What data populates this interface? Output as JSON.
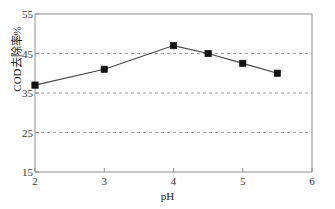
{
  "chart_data": {
    "type": "line",
    "title": "",
    "subtitle": "",
    "xlabel": "pH",
    "ylabel": "COD去除率%",
    "x": [
      2,
      3,
      4,
      4.5,
      5,
      5.5
    ],
    "values": [
      37,
      41,
      47,
      45,
      42.5,
      40
    ],
    "series": [
      {
        "name": "COD removal rate",
        "x": [
          2,
          3,
          4,
          4.5,
          5,
          5.5
        ],
        "values": [
          37,
          41,
          47,
          45,
          42.5,
          40
        ],
        "marker": "square",
        "marker_color": "#111111",
        "line_color": "#444444"
      }
    ],
    "xlim": [
      2,
      6
    ],
    "ylim": [
      15,
      55
    ],
    "xticks": [
      "2",
      "3",
      "4",
      "5",
      "6"
    ],
    "xtick_values": [
      2,
      3,
      4,
      5,
      6
    ],
    "yticks": [
      "15",
      "25",
      "35",
      "45",
      "55"
    ],
    "ytick_values": [
      15,
      25,
      35,
      45,
      55
    ],
    "grid": "horizontal-dashed",
    "gridlines_y": [
      25,
      35,
      45
    ],
    "grid_color": "#9a9a9a",
    "legend": "none",
    "legend_position": "none",
    "axis_color": "#8c8c8c",
    "background": "#ffffff"
  }
}
